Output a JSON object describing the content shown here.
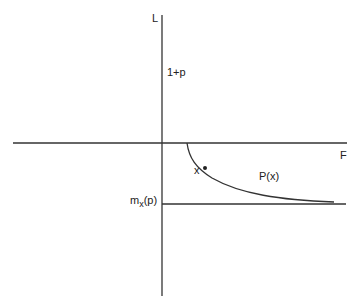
{
  "labels": {
    "y_axis": "L",
    "x_axis": "F",
    "one_plus_p": "1+p",
    "curve": "P(x)",
    "point": "x",
    "m_base": "m",
    "m_sub": "x",
    "m_arg": "(p)"
  },
  "colors": {
    "ink": "#333333",
    "background": "#ffffff"
  }
}
